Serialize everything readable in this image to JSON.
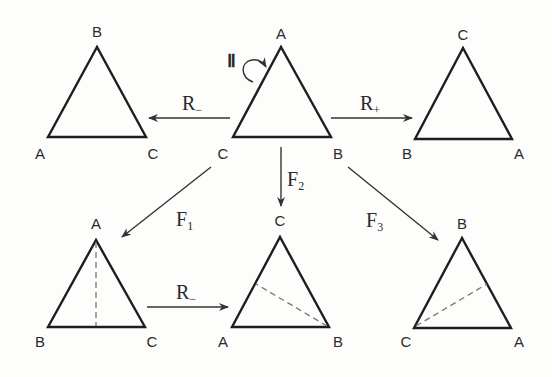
{
  "diagram": {
    "colors": {
      "stroke": "#1e1e1e",
      "dashed": "#777777",
      "background": "#fdfdfb"
    },
    "center_triangle": {
      "vertices": {
        "top": "A",
        "left": "C",
        "right": "B"
      },
      "identity_symbol": "Ⅱ"
    },
    "top_left_triangle": {
      "vertices": {
        "top": "B",
        "left": "A",
        "right": "C"
      }
    },
    "top_right_triangle": {
      "vertices": {
        "top": "C",
        "left": "B",
        "right": "A"
      }
    },
    "bottom_left_triangle": {
      "vertices": {
        "top": "A",
        "left": "B",
        "right": "C"
      },
      "axis": "vertical from A"
    },
    "bottom_middle_triangle": {
      "vertices": {
        "top": "C",
        "left": "A",
        "right": "B"
      },
      "axis": "from B"
    },
    "bottom_right_triangle": {
      "vertices": {
        "top": "B",
        "left": "C",
        "right": "A"
      },
      "axis": "from C"
    },
    "arrows": {
      "r_minus_top": {
        "label": "R",
        "sub": "−"
      },
      "r_plus_top": {
        "label": "R",
        "sub": "+"
      },
      "f1": {
        "label": "F",
        "sub": "1"
      },
      "f2": {
        "label": "F",
        "sub": "2"
      },
      "f3": {
        "label": "F",
        "sub": "3"
      },
      "r_minus_bottom": {
        "label": "R",
        "sub": "−"
      }
    }
  }
}
